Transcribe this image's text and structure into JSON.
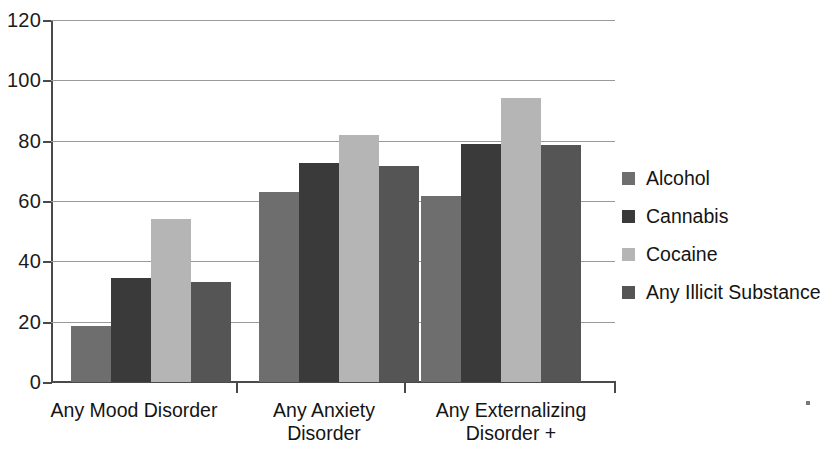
{
  "chart_data": {
    "type": "bar",
    "title": "",
    "subtitle": "",
    "xlabel": "",
    "ylabel": "",
    "ylim": [
      0,
      120
    ],
    "ytick_values": [
      0,
      20,
      40,
      60,
      80,
      100,
      120
    ],
    "ytick_labels": [
      "0",
      "20",
      "40",
      "60",
      "80",
      "100",
      "120"
    ],
    "grid": true,
    "grid_axis": "y",
    "legend_position": "right",
    "categories": [
      "Any Mood Disorder",
      "Any Anxiety Disorder",
      "Any Externalizing Disorder +"
    ],
    "category_label_lines": [
      [
        "Any Mood Disorder"
      ],
      [
        "Any Anxiety",
        "Disorder"
      ],
      [
        "Any Externalizing",
        "Disorder  +"
      ]
    ],
    "series": [
      {
        "name": "Alcohol",
        "color": "#6e6e6e",
        "values": [
          18.5,
          63,
          61.5
        ]
      },
      {
        "name": "Cannabis",
        "color": "#3a3a3a",
        "values": [
          34.5,
          72.5,
          79
        ]
      },
      {
        "name": "Cocaine",
        "color": "#b5b5b5",
        "values": [
          54,
          82,
          94
        ]
      },
      {
        "name": "Any Illicit Substance",
        "color": "#555555",
        "values": [
          33,
          71.5,
          78.5
        ]
      }
    ]
  },
  "legend": {
    "items": [
      {
        "label": "Alcohol",
        "color": "#6e6e6e"
      },
      {
        "label": "Cannabis",
        "color": "#3a3a3a"
      },
      {
        "label": "Cocaine",
        "color": "#b5b5b5"
      },
      {
        "label": "Any Illicit Substance",
        "color": "#555555"
      }
    ]
  },
  "axis": {
    "y_labels": [
      "120",
      "100",
      "80",
      "60",
      "40",
      "20",
      "0"
    ]
  }
}
